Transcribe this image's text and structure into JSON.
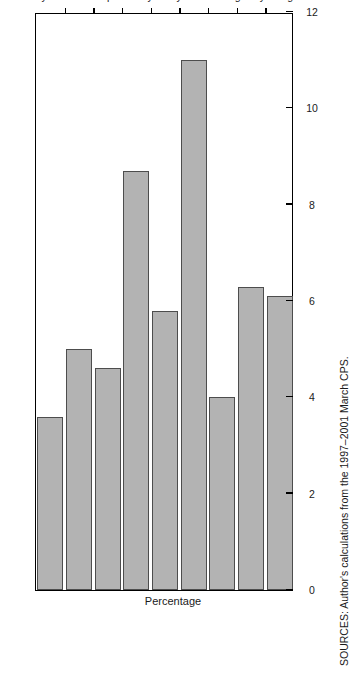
{
  "chart_data": {
    "type": "bar",
    "orientation": "vertical-rendered-rotated",
    "title": "",
    "xlabel": "",
    "ylabel": "Percentage",
    "ylim": [
      0,
      12
    ],
    "grid": false,
    "legend": null,
    "yticks": [
      "0",
      "2",
      "4",
      "6",
      "8",
      "10",
      "12"
    ],
    "ytick_values": [
      0,
      2,
      4,
      6,
      8,
      10,
      12
    ],
    "categories": [
      "Bay Area",
      "Central Coast",
      "Inland Empire",
      "Los Angeles County",
      "Orange County",
      "Sacramento Metro",
      "San Diego",
      "San Joaquin Valley",
      "State average"
    ],
    "category_label_lines": [
      [
        "Bay Area"
      ],
      [
        "Central",
        "Coast"
      ],
      [
        "Inland",
        "Empire"
      ],
      [
        "Los Angeles",
        "County"
      ],
      [
        "Orange",
        "County"
      ],
      [
        "Sacramento",
        "Metro"
      ],
      [
        "San Diego"
      ],
      [
        "San Joaquin",
        "Valley"
      ],
      [
        "State",
        "average"
      ]
    ],
    "values": [
      3.6,
      5.0,
      4.6,
      8.7,
      5.8,
      11.0,
      4.0,
      6.3,
      6.1
    ],
    "bar_color": "#b3b3b3",
    "bar_edge_color": "#4d4d4d",
    "axis_color": "#000000"
  },
  "source_note": "SOURCES: Author's calculations from the 1997–2001 March CPS."
}
